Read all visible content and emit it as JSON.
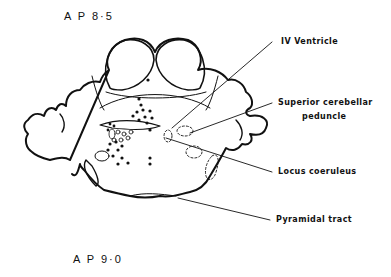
{
  "sections": {
    "top": "A P 8·5",
    "bottom": "A P 9·0"
  },
  "labels": {
    "iv_ventricle": "IV Ventricle",
    "superior_cerebellar_line1": "Superior cerebellar",
    "superior_cerebellar_line2": "peduncle",
    "locus_coeruleus": "Locus coeruleus",
    "pyramidal_tract": "Pyramidal tract"
  },
  "colors": {
    "ink": "#111111",
    "background": "#ffffff"
  }
}
